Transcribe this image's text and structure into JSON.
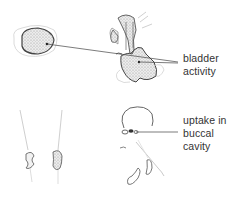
{
  "diagram": {
    "type": "anatomical-sketch",
    "annotations": [
      {
        "id": "bladder",
        "lines": [
          "bladder",
          "activity"
        ]
      },
      {
        "id": "buccal",
        "lines": [
          "uptake in",
          "buccal",
          "cavity"
        ]
      }
    ],
    "colors": {
      "stroke": "#555555",
      "faint_stroke": "#c8c8c8",
      "fill_stipple": "#d9d9d9",
      "text": "#333333",
      "background": "#ffffff"
    }
  }
}
